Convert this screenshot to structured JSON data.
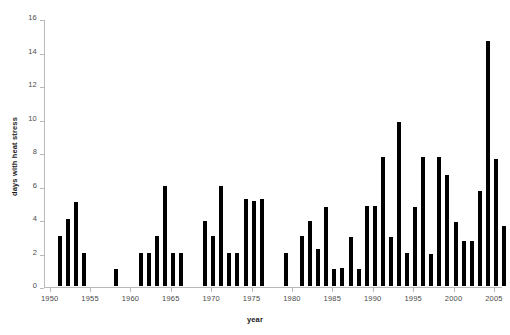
{
  "chart_data": {
    "type": "bar",
    "title": "",
    "xlabel": "year",
    "ylabel": "days with heat stress",
    "xlim": [
      1949.3,
      2006.0
    ],
    "ylim": [
      0,
      16
    ],
    "ytick_values": [
      0,
      2,
      4,
      6,
      8,
      10,
      12,
      14,
      16
    ],
    "ytick_labels": [
      "0",
      "2",
      "4",
      "6",
      "8",
      "10",
      "12",
      "14",
      "16"
    ],
    "xtick_values": [
      1950,
      1955,
      1960,
      1965,
      1970,
      1975,
      1980,
      1985,
      1990,
      1995,
      2000,
      2005
    ],
    "xtick_labels": [
      "1950",
      "1955",
      "1960",
      "1965",
      "1970",
      "1975",
      "1980",
      "1985",
      "1990",
      "1995",
      "2000",
      "2005"
    ],
    "grid": false,
    "legend": false,
    "bar_color": "#000000",
    "axis_color": "#b9b9b9",
    "categories": [
      1950,
      1951,
      1952,
      1953,
      1954,
      1955,
      1956,
      1957,
      1958,
      1959,
      1960,
      1961,
      1962,
      1963,
      1964,
      1965,
      1966,
      1967,
      1968,
      1969,
      1970,
      1971,
      1972,
      1973,
      1974,
      1975,
      1976,
      1977,
      1978,
      1979,
      1980,
      1981,
      1982,
      1983,
      1984,
      1985,
      1986,
      1987,
      1988,
      1989,
      1990,
      1991,
      1992,
      1993,
      1994,
      1995,
      1996,
      1997,
      1998,
      1999,
      2000,
      2001,
      2002,
      2003,
      2004,
      2005
    ],
    "values": [
      0,
      3,
      4,
      5,
      2,
      0,
      0,
      0,
      1,
      0,
      0,
      2,
      2,
      3,
      6,
      2,
      2,
      0,
      0,
      4,
      3,
      6,
      2,
      2,
      5,
      5,
      5,
      0,
      0,
      2,
      0,
      3,
      4,
      2,
      5,
      1,
      1,
      3,
      1,
      5,
      5,
      8,
      3,
      10,
      2,
      5,
      8,
      2,
      8,
      7,
      4,
      3,
      3,
      6,
      15,
      4
    ],
    "series_name": "days with heat stress"
  },
  "bars": [
    {
      "year": "1951",
      "value": 3.0
    },
    {
      "year": "1952",
      "value": 4.0
    },
    {
      "year": "1953",
      "value": 5.0
    },
    {
      "year": "1954",
      "value": 2.0
    },
    {
      "year": "1958",
      "value": 1.0
    },
    {
      "year": "1961",
      "value": 2.0
    },
    {
      "year": "1962",
      "value": 2.0
    },
    {
      "year": "1963",
      "value": 3.0
    },
    {
      "year": "1964",
      "value": 6.0
    },
    {
      "year": "1965",
      "value": 2.0
    },
    {
      "year": "1966",
      "value": 2.0
    },
    {
      "year": "1969",
      "value": 3.9
    },
    {
      "year": "1970",
      "value": 3.0
    },
    {
      "year": "1971",
      "value": 6.0
    },
    {
      "year": "1972",
      "value": 2.0
    },
    {
      "year": "1973",
      "value": 2.0
    },
    {
      "year": "1974",
      "value": 5.2
    },
    {
      "year": "1975",
      "value": 5.1
    },
    {
      "year": "1976",
      "value": 5.2
    },
    {
      "year": "1979",
      "value": 2.0
    },
    {
      "year": "1981",
      "value": 3.0
    },
    {
      "year": "1982",
      "value": 3.9
    },
    {
      "year": "1983",
      "value": 2.2
    },
    {
      "year": "1984",
      "value": 4.7
    },
    {
      "year": "1985",
      "value": 1.0
    },
    {
      "year": "1986",
      "value": 1.1
    },
    {
      "year": "1987",
      "value": 2.9
    },
    {
      "year": "1988",
      "value": 1.0
    },
    {
      "year": "1989",
      "value": 4.8
    },
    {
      "year": "1990",
      "value": 4.8
    },
    {
      "year": "1991",
      "value": 7.7
    },
    {
      "year": "1992",
      "value": 2.9
    },
    {
      "year": "1993",
      "value": 9.8
    },
    {
      "year": "1994",
      "value": 2.0
    },
    {
      "year": "1995",
      "value": 4.7
    },
    {
      "year": "1996",
      "value": 7.7
    },
    {
      "year": "1997",
      "value": 1.9
    },
    {
      "year": "1998",
      "value": 7.7
    },
    {
      "year": "1999",
      "value": 6.6
    },
    {
      "year": "2000",
      "value": 3.8
    },
    {
      "year": "2001",
      "value": 2.7
    },
    {
      "year": "2002",
      "value": 2.7
    },
    {
      "year": "2003",
      "value": 5.7
    },
    {
      "year": "2004",
      "value": 14.6
    },
    {
      "year": "2005",
      "value": 7.6
    },
    {
      "year": "2006",
      "value": 3.6
    }
  ]
}
